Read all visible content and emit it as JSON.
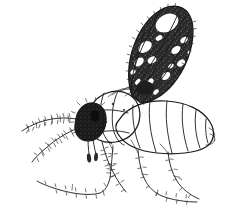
{
  "image": {
    "kind": "scientific-line-drawing",
    "subject": "winged insect, lateral view",
    "common_name": "biting midge",
    "technique": "stippled pen-and-ink",
    "background_color": "#ffffff",
    "ink_color": "#1a1a1a",
    "width_px": 226,
    "height_px": 216,
    "caption": ""
  },
  "parts": {
    "wing": {
      "name": "wing",
      "label": "patterned wing raised over back",
      "pattern": "dark mottled with pale cells",
      "dark_color": "#242424",
      "pale_color": "#ffffff"
    },
    "head": {
      "name": "head",
      "label": "dark head capsule",
      "color": "#1c1c1c"
    },
    "eye": {
      "name": "compound-eye",
      "label": "compound eye"
    },
    "antenna_upper": {
      "name": "antenna-upper",
      "label": "upper antenna"
    },
    "antenna_lower": {
      "name": "antenna-lower",
      "label": "lower antenna"
    },
    "proboscis": {
      "name": "proboscis",
      "label": "proboscis and palps"
    },
    "thorax": {
      "name": "thorax",
      "label": "thorax"
    },
    "abdomen": {
      "name": "abdomen",
      "label": "segmented abdomen",
      "segment_count": 7
    },
    "legs": [
      {
        "name": "foreleg",
        "label": "foreleg"
      },
      {
        "name": "midleg",
        "label": "midleg"
      },
      {
        "name": "hindleg",
        "label": "hindleg"
      },
      {
        "name": "hindleg-far",
        "label": "far hindleg"
      }
    ]
  }
}
